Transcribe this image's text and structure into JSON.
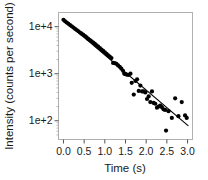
{
  "figure": {
    "background": "#ffffff",
    "frame_color": "#b0b0b0",
    "marker_color": "#000000",
    "line_color": "#000000"
  },
  "chart_data": {
    "type": "scatter",
    "title": "",
    "xlabel": "Time (s)",
    "ylabel": "Intensity (counts per second)",
    "xlim": [
      -0.12,
      3.12
    ],
    "ylim": [
      40,
      20000
    ],
    "yscale": "log",
    "xscale": "linear",
    "grid": false,
    "legend": null,
    "xticks": [
      0.0,
      0.5,
      1.0,
      1.5,
      2.0,
      2.5,
      3.0
    ],
    "xticklabels": [
      "0.0",
      "0.5",
      "1.0",
      "1.5",
      "2.0",
      "2.5",
      "3.0"
    ],
    "yticks": [
      100,
      1000,
      10000
    ],
    "yticklabels": [
      "1e+2",
      "1e+3",
      "1e+4"
    ],
    "series": [
      {
        "name": "decay-data",
        "type": "scatter",
        "marker": "circle",
        "color": "#000000",
        "points": [
          [
            0.0,
            14000
          ],
          [
            0.04,
            13000
          ],
          [
            0.08,
            12200
          ],
          [
            0.12,
            11500
          ],
          [
            0.16,
            10800
          ],
          [
            0.2,
            10200
          ],
          [
            0.24,
            9600
          ],
          [
            0.28,
            9000
          ],
          [
            0.32,
            8500
          ],
          [
            0.36,
            8000
          ],
          [
            0.4,
            7500
          ],
          [
            0.44,
            7100
          ],
          [
            0.48,
            6700
          ],
          [
            0.52,
            6300
          ],
          [
            0.56,
            5900
          ],
          [
            0.6,
            5500
          ],
          [
            0.64,
            5200
          ],
          [
            0.68,
            4900
          ],
          [
            0.72,
            4600
          ],
          [
            0.76,
            4300
          ],
          [
            0.8,
            4000
          ],
          [
            0.84,
            3750
          ],
          [
            0.88,
            3500
          ],
          [
            0.92,
            3250
          ],
          [
            0.96,
            3050
          ],
          [
            1.0,
            2850
          ],
          [
            1.04,
            2650
          ],
          [
            1.08,
            2450
          ],
          [
            1.12,
            2300
          ],
          [
            1.16,
            2150
          ],
          [
            1.2,
            1700
          ],
          [
            1.24,
            1680
          ],
          [
            1.28,
            1620
          ],
          [
            1.32,
            1500
          ],
          [
            1.36,
            1400
          ],
          [
            1.4,
            1280
          ],
          [
            1.44,
            1150
          ],
          [
            1.47,
            1000
          ],
          [
            1.5,
            980
          ],
          [
            1.53,
            960
          ],
          [
            1.57,
            940
          ],
          [
            1.62,
            1000
          ],
          [
            1.65,
            640
          ],
          [
            1.7,
            360
          ],
          [
            1.74,
            700
          ],
          [
            1.78,
            760
          ],
          [
            1.82,
            430
          ],
          [
            1.86,
            560
          ],
          [
            1.9,
            420
          ],
          [
            1.94,
            420
          ],
          [
            1.98,
            400
          ],
          [
            2.02,
            290
          ],
          [
            2.06,
            330
          ],
          [
            2.1,
            250
          ],
          [
            2.14,
            420
          ],
          [
            2.18,
            240
          ],
          [
            2.22,
            230
          ],
          [
            2.26,
            190
          ],
          [
            2.3,
            200
          ],
          [
            2.34,
            210
          ],
          [
            2.38,
            195
          ],
          [
            2.42,
            175
          ],
          [
            2.46,
            170
          ],
          [
            2.48,
            62
          ],
          [
            2.54,
            160
          ],
          [
            2.62,
            115
          ],
          [
            2.7,
            300
          ],
          [
            2.78,
            125
          ],
          [
            2.86,
            250
          ],
          [
            2.94,
            130
          ],
          [
            2.98,
            115
          ]
        ]
      },
      {
        "name": "exponential-fit",
        "type": "line",
        "color": "#000000",
        "endpoints": [
          [
            0.02,
            13500
          ],
          [
            3.02,
            78
          ]
        ]
      }
    ]
  }
}
